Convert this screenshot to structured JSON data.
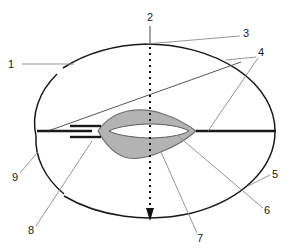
{
  "figure": {
    "type": "technical-cross-section-diagram",
    "background_color": "#ffffff",
    "width": 291,
    "height": 251,
    "outline_color": "#1a1a1a",
    "leader_color": "#8a8a8a",
    "shading_fill": "#b3b3b3",
    "shading_stroke": "#6e6e6e",
    "inner_void_fill": "#ffffff",
    "thick_line_color": "#1a1a1a",
    "axis_color": "#111111"
  },
  "callouts": [
    {
      "id": "1",
      "label": "1",
      "text_x": 11,
      "text_y": 68,
      "leader": "horizontal line from number to gap in outer boundary at upper-left"
    },
    {
      "id": "2",
      "label": "2",
      "text_x": 148,
      "text_y": 21,
      "leader": "short vertical stub down to top of dotted centre axis"
    },
    {
      "id": "3",
      "label": "3",
      "text_x": 244,
      "text_y": 37,
      "leader": "diagonal down-left to top of outer boundary arc"
    },
    {
      "id": "4",
      "label": "4",
      "text_x": 258,
      "text_y": 56,
      "leader": "two branches: one down-left to thin inclined line, one down-left to thick horizontal line"
    },
    {
      "id": "5",
      "label": "5",
      "text_x": 272,
      "text_y": 178,
      "leader": "short diagonal down-left to right outer boundary arc"
    },
    {
      "id": "6",
      "label": "6",
      "text_x": 264,
      "text_y": 214,
      "leader": "long diagonal up-left to white inner opening of lens"
    },
    {
      "id": "7",
      "label": "7",
      "text_x": 196,
      "text_y": 241,
      "leader": "long diagonal up-left to shaded lens body"
    },
    {
      "id": "8",
      "label": "8",
      "text_x": 31,
      "text_y": 233,
      "leader": "long diagonal up-right to lower short thick stub"
    },
    {
      "id": "9",
      "label": "9",
      "text_x": 13,
      "text_y": 180,
      "leader": "short diagonal up-right to left outer boundary arc"
    }
  ],
  "geometry": {
    "outer_boundary": {
      "name": "outer-ellipse",
      "center_x": 146,
      "center_y": 131,
      "radius_x": 129,
      "radius_y": 87,
      "gaps": [
        "upper-left",
        "lower-left"
      ]
    },
    "centre_axis": {
      "name": "dotted-vertical-axis",
      "x": 150,
      "y_top": 26,
      "y_bottom": 219,
      "style": "dotted",
      "arrowhead": "bottom"
    },
    "lens": {
      "name": "shaded-lens-body",
      "left_x": 98,
      "right_x": 196,
      "top_y": 110,
      "bottom_y": 161,
      "mid_y": 131
    },
    "inner_opening": {
      "name": "white-slit",
      "left_x": 109,
      "right_x": 189,
      "mid_y": 131,
      "half_height": 6
    },
    "thick_right_line": {
      "x1": 196,
      "x2": 276,
      "y": 131
    },
    "thick_left_line": {
      "x1": 37,
      "x2": 92,
      "y": 131
    },
    "thick_stub_upper": {
      "x1": 70,
      "x2": 100,
      "y": 127
    },
    "thick_stub_lower": {
      "x1": 70,
      "x2": 100,
      "y": 137
    },
    "inclined_line": {
      "x1": 48,
      "y1": 131,
      "x2": 241,
      "y2": 62
    }
  }
}
